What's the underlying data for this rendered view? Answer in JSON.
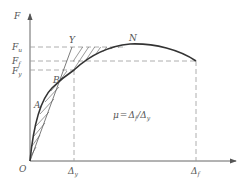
{
  "diagram": {
    "type": "force-displacement curve (ductility)",
    "axes": {
      "y_label": "F",
      "origin_label": "O",
      "y_ticks": [
        {
          "main": "F",
          "sub": "u"
        },
        {
          "main": "F",
          "sub": "f"
        },
        {
          "main": "F",
          "sub": "y"
        }
      ],
      "x_ticks": [
        {
          "main": "Δ",
          "sub": "y"
        },
        {
          "main": "Δ",
          "sub": "f"
        }
      ]
    },
    "points": {
      "A": "A",
      "B": "B",
      "Y": "Y",
      "N": "N"
    },
    "formula": {
      "lhs": "μ",
      "eq": "=",
      "num_main": "Δ",
      "num_sub": "f",
      "slash": "/",
      "den_main": "Δ",
      "den_sub": "y"
    },
    "colors": {
      "curve": "#333333",
      "axis": "#555555",
      "dash": "#999999",
      "hatch": "#555555"
    }
  }
}
